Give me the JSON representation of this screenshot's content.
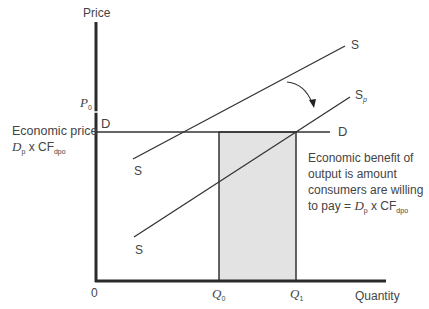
{
  "diagram": {
    "type": "supply-demand-economic-benefit",
    "axes": {
      "y_label": "Price",
      "x_label": "Quantity",
      "origin_label": "0"
    },
    "price_marks": {
      "p0": {
        "symbol": "P",
        "subscript": "0"
      }
    },
    "demand": {
      "label_left": "D",
      "label_right": "D"
    },
    "economic_price": {
      "line1": "Economic price",
      "symbol": "D",
      "symbol_sub": "p",
      "times": " x CF",
      "cf_sub": "dpo"
    },
    "supply": {
      "top_label": "S",
      "bottom_label": "S"
    },
    "supply_shifted": {
      "top_label": "S",
      "top_label_sub": "p",
      "bottom_label": "S"
    },
    "quantities": {
      "q0": {
        "symbol": "Q",
        "subscript": "0"
      },
      "q1": {
        "symbol": "Q",
        "subscript": "1"
      }
    },
    "annotation": {
      "line1": "Economic benefit of",
      "line2": "output is amount",
      "line3": "consumers are willing",
      "line4_prefix": "to pay = ",
      "symbol": "D",
      "symbol_sub": "p",
      "times": " x CF",
      "cf_sub": "dpo"
    },
    "colors": {
      "axis": "#2b2b2b",
      "line": "#333333",
      "shade": "#e3e3e3"
    }
  }
}
